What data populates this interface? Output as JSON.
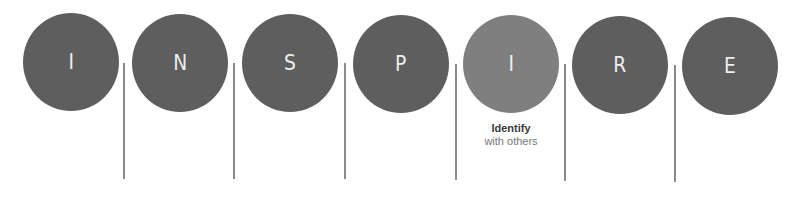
{
  "acronym": "INSPIRE",
  "circles": [
    {
      "letter": "I",
      "highlighted": false
    },
    {
      "letter": "N",
      "highlighted": false
    },
    {
      "letter": "S",
      "highlighted": false
    },
    {
      "letter": "P",
      "highlighted": false
    },
    {
      "letter": "I",
      "highlighted": true
    },
    {
      "letter": "R",
      "highlighted": false
    },
    {
      "letter": "E",
      "highlighted": false
    }
  ],
  "caption": {
    "title": "Identify",
    "subtitle": "with others"
  },
  "colors": {
    "circle": "#5e5e5e",
    "circle_highlight": "#7f7f7f",
    "divider": "#8a8a8a",
    "letter": "#eeeeee"
  }
}
